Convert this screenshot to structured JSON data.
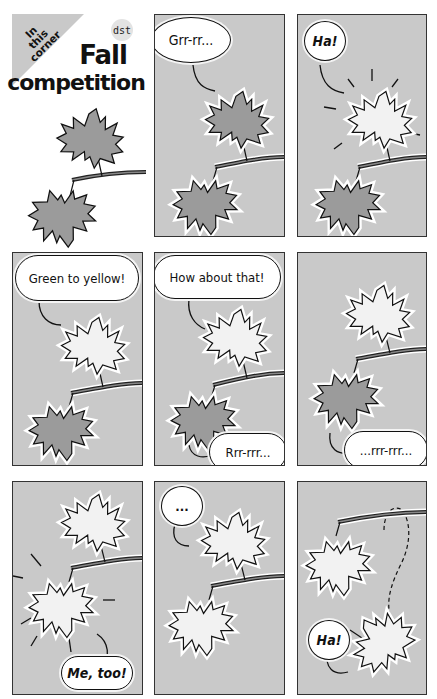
{
  "header": {
    "corner_lines": [
      "In",
      "this",
      "corner"
    ],
    "title_line1": "Fall",
    "title_line2": "competition",
    "logo": "dst"
  },
  "colors": {
    "panel_bg": "#c9c9c9",
    "dark_leaf": "#9b9b9b",
    "light_leaf": "#f2f2f2",
    "outline": "#111111"
  },
  "panels": [
    {
      "id": 1,
      "bubbles": []
    },
    {
      "id": 2,
      "bubbles": [
        {
          "text": "Grr-rr..."
        }
      ]
    },
    {
      "id": 3,
      "bubbles": [
        {
          "text": "Ha!"
        }
      ]
    },
    {
      "id": 4,
      "bubbles": [
        {
          "text": "Green to yellow!"
        }
      ]
    },
    {
      "id": 5,
      "bubbles": [
        {
          "text": "How about that!"
        },
        {
          "text": "Rrr-rrr..."
        }
      ]
    },
    {
      "id": 6,
      "bubbles": [
        {
          "text": "...rrr-rrr..."
        }
      ]
    },
    {
      "id": 7,
      "bubbles": [
        {
          "text": "Me, too!"
        }
      ]
    },
    {
      "id": 8,
      "bubbles": [
        {
          "text": "..."
        }
      ]
    },
    {
      "id": 9,
      "bubbles": [
        {
          "text": "Ha!"
        }
      ]
    }
  ]
}
